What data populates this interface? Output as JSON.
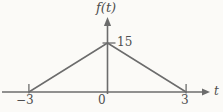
{
  "chart_data": {
    "type": "line",
    "title": "",
    "xlabel": "t",
    "ylabel": "f(t)",
    "x": [
      -3,
      0,
      3
    ],
    "y": [
      0,
      15,
      0
    ],
    "xticks": [
      -3,
      3
    ],
    "xtick_labels": [
      "−3",
      "0",
      "3"
    ],
    "yticks": [
      15
    ],
    "ytick_labels": [
      "15"
    ],
    "xlim": [
      -4.1,
      4.4
    ],
    "ylim": [
      0,
      22.5
    ],
    "grid": false,
    "legend": "none",
    "line_color": "#6c6c6c",
    "text_color": "#4e4e4e",
    "background_color": "#fbfaf7"
  }
}
